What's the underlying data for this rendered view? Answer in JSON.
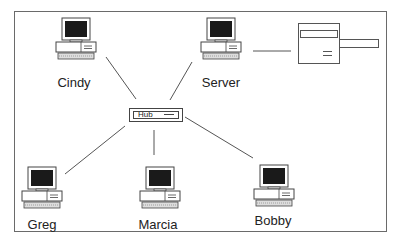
{
  "diagram": {
    "type": "star-network",
    "hub": {
      "label": "Hub"
    },
    "nodes": [
      {
        "id": "cindy",
        "label": "Cindy"
      },
      {
        "id": "server",
        "label": "Server"
      },
      {
        "id": "greg",
        "label": "Greg"
      },
      {
        "id": "marcia",
        "label": "Marcia"
      },
      {
        "id": "bobby",
        "label": "Bobby"
      }
    ],
    "peripherals": [
      {
        "id": "printer",
        "label": "",
        "attached_to": "server"
      }
    ],
    "edges": [
      [
        "cindy",
        "hub"
      ],
      [
        "server",
        "hub"
      ],
      [
        "greg",
        "hub"
      ],
      [
        "marcia",
        "hub"
      ],
      [
        "bobby",
        "hub"
      ],
      [
        "server",
        "printer"
      ]
    ]
  }
}
